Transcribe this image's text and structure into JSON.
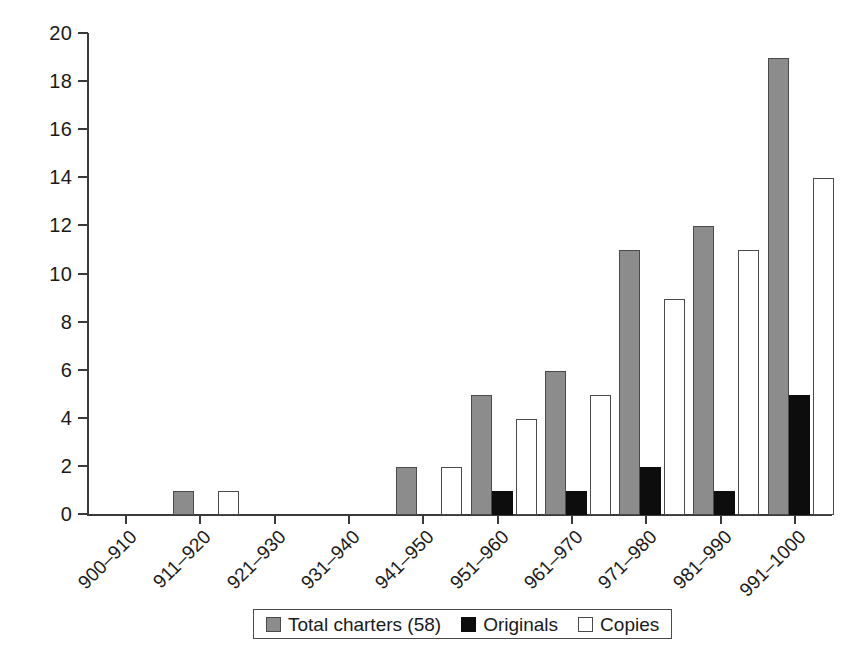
{
  "chart_data": {
    "type": "bar",
    "title": "",
    "subtitle": "",
    "xlabel": "",
    "ylabel": "",
    "ylim": [
      0,
      20
    ],
    "ytick_step": 2,
    "ytick_labels": [
      "0",
      "2",
      "4",
      "6",
      "8",
      "10",
      "12",
      "14",
      "16",
      "18",
      "20"
    ],
    "grid": false,
    "legend_position": "bottom-center",
    "categories": [
      "900–910",
      "911–920",
      "921–930",
      "931–940",
      "941–950",
      "951–960",
      "961–970",
      "971–980",
      "981–990",
      "991–1000"
    ],
    "series": [
      {
        "name": "Total charters (58)",
        "color": "#8c8c8c",
        "values": [
          0,
          1,
          0,
          0,
          2,
          5,
          6,
          11,
          12,
          19
        ]
      },
      {
        "name": "Originals",
        "color": "#0d0d0d",
        "values": [
          0,
          0,
          0,
          0,
          0,
          1,
          1,
          2,
          1,
          5
        ]
      },
      {
        "name": "Copies",
        "color": "#ffffff",
        "values": [
          0,
          1,
          0,
          0,
          2,
          4,
          5,
          9,
          11,
          14
        ]
      }
    ]
  },
  "legend": {
    "items": [
      {
        "label": "Total charters (58)",
        "swatch": "sw-total"
      },
      {
        "label": "Originals",
        "swatch": "sw-orig"
      },
      {
        "label": "Copies",
        "swatch": "sw-copies"
      }
    ]
  }
}
